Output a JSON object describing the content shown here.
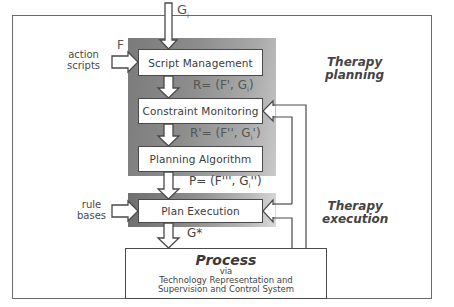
{
  "diagram": {
    "title": "",
    "phases": {
      "planning": "Therapy planning",
      "execution": "Therapy execution"
    },
    "phase_lines": {
      "planning": [
        "Therapy",
        "planning"
      ],
      "execution": [
        "Therapy",
        "execution"
      ]
    },
    "boxes": {
      "script_management": "Script Management",
      "constraint_monitoring": "Constraint Monitoring",
      "planning_algorithm": "Planning Algorithm",
      "plan_execution": "Plan Execution"
    },
    "process": {
      "title": "Process",
      "via": "via",
      "line1": "Technology Representation and",
      "line2": "Supervision and Control System"
    },
    "inputs": {
      "goal_top": "G",
      "goal_top_sub": "i",
      "action_scripts": [
        "action",
        "scripts"
      ],
      "action_scripts_symbol": "F",
      "rule_bases": [
        "rule",
        "bases"
      ]
    },
    "formulas": {
      "r": "R= (F', G",
      "r_sub": "i",
      "r_close": ")",
      "r_prime": "R'= (F'', G",
      "r_prime_sub": "i",
      "r_prime_close": "')",
      "p": "P= (F''', G",
      "p_sub": "i",
      "p_close": "'')",
      "g_star": "G*"
    },
    "colors": {
      "line": "#4a4a4a",
      "panel_dark": "#7a7a7a",
      "panel_light": "#d0d0d0",
      "background": "#ffffff"
    }
  }
}
